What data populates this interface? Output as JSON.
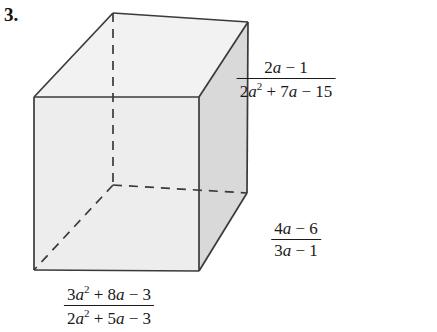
{
  "problem": {
    "number": "3."
  },
  "figure": {
    "shape_name": "rectangular-box",
    "colors": {
      "edge": "#3a3a3a",
      "hidden_edge": "#3a3a3a",
      "top_face": "#f2f2f2",
      "front_face": "#ededed",
      "right_face": "#d9d9d9",
      "text": "#1a1a1a",
      "background": "#ffffff"
    },
    "vertices": {
      "front_top_left": [
        34,
        97
      ],
      "front_top_right": [
        199,
        97
      ],
      "front_bottom_left": [
        34,
        270
      ],
      "front_bottom_right": [
        199,
        271
      ],
      "back_top_left": [
        113,
        13
      ],
      "back_top_right": [
        248,
        22
      ],
      "back_bottom_right": [
        247,
        193
      ],
      "back_bottom_left_hidden": [
        113,
        185
      ]
    }
  },
  "labels": {
    "top_right": {
      "name": "height-label",
      "numerator": {
        "text": "2a − 1",
        "parts": [
          {
            "t": "2",
            "style": "normal"
          },
          {
            "t": "a",
            "style": "italic"
          },
          {
            "t": " − 1",
            "style": "normal"
          }
        ]
      },
      "denominator": {
        "text": "2a2 + 7a − 15",
        "parts": [
          {
            "t": "2",
            "style": "normal"
          },
          {
            "t": "a",
            "style": "italic"
          },
          {
            "t": "2",
            "style": "sup"
          },
          {
            "t": " + 7",
            "style": "normal"
          },
          {
            "t": "a",
            "style": "italic"
          },
          {
            "t": " − 15",
            "style": "normal"
          }
        ]
      }
    },
    "right_lower": {
      "name": "depth-label",
      "numerator": {
        "text": "4a − 6",
        "parts": [
          {
            "t": "4",
            "style": "normal"
          },
          {
            "t": "a",
            "style": "italic"
          },
          {
            "t": " − 6",
            "style": "normal"
          }
        ]
      },
      "denominator": {
        "text": "3a − 1",
        "parts": [
          {
            "t": "3",
            "style": "normal"
          },
          {
            "t": "a",
            "style": "italic"
          },
          {
            "t": " − 1",
            "style": "normal"
          }
        ]
      }
    },
    "bottom": {
      "name": "width-label",
      "numerator": {
        "text": "3a2 + 8a − 3",
        "parts": [
          {
            "t": "3",
            "style": "normal"
          },
          {
            "t": "a",
            "style": "italic"
          },
          {
            "t": "2",
            "style": "sup"
          },
          {
            "t": " + 8",
            "style": "normal"
          },
          {
            "t": "a",
            "style": "italic"
          },
          {
            "t": " − 3",
            "style": "normal"
          }
        ]
      },
      "denominator": {
        "text": "2a2 + 5a − 3",
        "parts": [
          {
            "t": "2",
            "style": "normal"
          },
          {
            "t": "a",
            "style": "italic"
          },
          {
            "t": "2",
            "style": "sup"
          },
          {
            "t": " + 5",
            "style": "normal"
          },
          {
            "t": "a",
            "style": "italic"
          },
          {
            "t": " − 3",
            "style": "normal"
          }
        ]
      }
    }
  }
}
